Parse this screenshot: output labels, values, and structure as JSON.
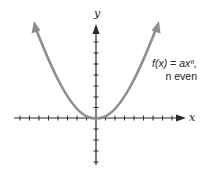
{
  "diagram": {
    "axes": {
      "x_label": "x",
      "y_label": "y"
    },
    "function_label": {
      "line1": "f(x) = axⁿ,",
      "line2": "n even"
    },
    "colors": {
      "curve": "#8e8e8e",
      "axis": "#2a2a2a",
      "background": "#ffffff"
    },
    "curve": {
      "shape": "parabola-like (U-shaped), vertex at origin, opening upward",
      "ends": "arrows on both ends"
    },
    "ticks": {
      "x_negative_count": 8,
      "x_positive_count": 8,
      "y_positive_count": 8,
      "y_negative_count": 4
    }
  }
}
